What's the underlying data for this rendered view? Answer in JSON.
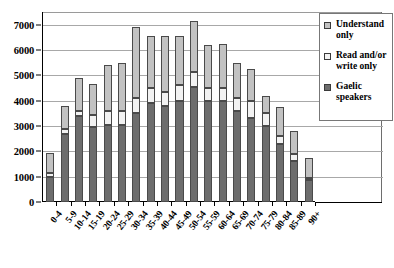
{
  "chart_data": {
    "type": "bar",
    "stacked": true,
    "title": "",
    "subtitle": "",
    "xlabel": "",
    "ylabel": "",
    "ylim": [
      0,
      7500
    ],
    "grid": true,
    "legend_position": "top-right",
    "categories": [
      "0-4",
      "5-9",
      "10-14",
      "15-19",
      "20-24",
      "25-29",
      "30-34",
      "35-39",
      "40-44",
      "45-49",
      "50-54",
      "55-59",
      "60-64",
      "65-69",
      "70-74",
      "75-79",
      "80-84",
      "85-89",
      "90+"
    ],
    "y_ticks": [
      0,
      1000,
      2000,
      3000,
      4000,
      5000,
      6000,
      7000
    ],
    "y_tick_labels": [
      "0",
      "1000",
      "2000",
      "3000",
      "4000",
      "5000",
      "6000",
      "7000"
    ],
    "series": [
      {
        "name": "Gaelic speakers",
        "color": "#6d6d6d",
        "values": [
          1000,
          2700,
          3400,
          2950,
          3050,
          3050,
          3500,
          3900,
          3800,
          4000,
          4550,
          4000,
          4000,
          3600,
          3300,
          3000,
          2300,
          1600,
          850
        ]
      },
      {
        "name": "Read and/or write only",
        "color": "#f2f2f2",
        "values": [
          150,
          200,
          200,
          500,
          550,
          550,
          600,
          600,
          550,
          600,
          600,
          500,
          500,
          500,
          700,
          500,
          300,
          300,
          100
        ]
      },
      {
        "name": "Understand only",
        "color": "#c2c2c2",
        "values": [
          800,
          900,
          1300,
          1200,
          1800,
          1900,
          2800,
          2050,
          2200,
          1950,
          2000,
          1700,
          1750,
          1400,
          1250,
          700,
          1150,
          900,
          800
        ]
      }
    ],
    "totals": [
      1950,
      3800,
      4900,
      4650,
      5400,
      5500,
      6900,
      6550,
      6550,
      6550,
      7150,
      6200,
      6250,
      5500,
      5250,
      4200,
      3750,
      2800,
      1750
    ]
  },
  "legend": {
    "items": [
      {
        "label": "Understand only",
        "swatch": "understand-only-swatch"
      },
      {
        "label": "Read and/or write only",
        "swatch": "read-write-only-swatch"
      },
      {
        "label": "Gaelic speakers",
        "swatch": "gaelic-speakers-swatch"
      }
    ]
  }
}
